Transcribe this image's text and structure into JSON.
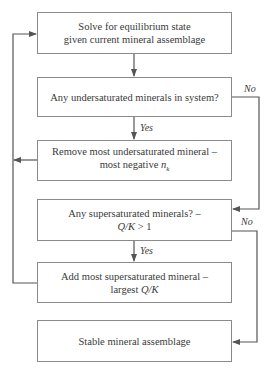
{
  "flowchart": {
    "nodes": [
      {
        "id": "solve",
        "line1": "Solve for equilibrium state",
        "line2": "given current mineral assemblage"
      },
      {
        "id": "check_under",
        "line1": "Any undersaturated minerals in system?"
      },
      {
        "id": "remove",
        "line1": "Remove most undersaturated mineral –",
        "line2_prefix": "most negative ",
        "line2_var": "n",
        "line2_sub": "k"
      },
      {
        "id": "check_super",
        "line1": "Any supersaturated minerals? –",
        "line2_var": "Q/K",
        "line2_suffix": " > 1"
      },
      {
        "id": "add",
        "line1": "Add most supersaturated mineral –",
        "line2_prefix": "largest ",
        "line2_var": "Q/K"
      },
      {
        "id": "stable",
        "line1": "Stable mineral assemblage"
      }
    ],
    "edge_labels": {
      "under_no": "No",
      "under_yes": "Yes",
      "super_no": "No",
      "super_yes": "Yes"
    },
    "colors": {
      "border": "#8a8a8a",
      "connector": "#555555",
      "text": "#3a3a3a"
    }
  }
}
